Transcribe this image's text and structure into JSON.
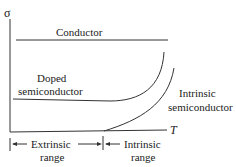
{
  "diagram": {
    "title": "",
    "y_axis_label": "σ",
    "x_axis_label": "T",
    "curves": {
      "conductor": "Conductor",
      "doped_line1": "Doped",
      "doped_line2": "semiconductor",
      "intrinsic_line1": "Intrinsic",
      "intrinsic_line2": "semiconductor"
    },
    "ranges": {
      "extrinsic_line1": "Extrinsic",
      "extrinsic_line2": "range",
      "intrinsic_line1": "Intrinsic",
      "intrinsic_line2": "range"
    },
    "colors": {
      "line": "#333333",
      "text": "#222222",
      "background": "#ffffff"
    }
  }
}
